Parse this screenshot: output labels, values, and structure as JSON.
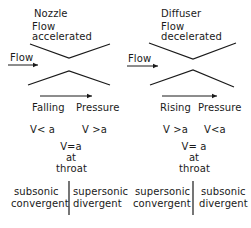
{
  "nozzle": {
    "title": "Nozzle",
    "flow_state_line1": "Flow",
    "flow_state_line2": "accelerated",
    "flow_label": "Flow",
    "pressure_word1": "Falling",
    "pressure_word2": "Pressure",
    "inlet_velocity": "V< a",
    "outlet_velocity": "V >a",
    "throat_line1": "V=a",
    "throat_line2": "at",
    "throat_line3": "throat",
    "left_regime_line1": "subsonic",
    "left_regime_line2": "convergent",
    "right_regime_line1": "supersonic",
    "right_regime_line2": "divergent"
  },
  "diffuser": {
    "title": "Diffuser",
    "flow_state_line1": "Flow",
    "flow_state_line2": "decelerated",
    "flow_label": "Flow",
    "pressure_word1": "Rising",
    "pressure_word2": "Pressure",
    "inlet_velocity": "V >a",
    "outlet_velocity": "V<a",
    "throat_line1": "V= a",
    "throat_line2": "at",
    "throat_line3": "throat",
    "left_regime_line1": "supersonic",
    "left_regime_line2": "convergent",
    "right_regime_line1": "subsonic",
    "right_regime_line2": "divergent"
  },
  "colors": {
    "ink": "#1a1a1a",
    "background": "#ffffff"
  }
}
